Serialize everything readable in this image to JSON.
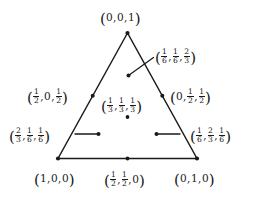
{
  "figure": {
    "type": "2-simplex-barycentric-diagram",
    "stroke_color": "#1a1a1a",
    "background_color": "#ffffff",
    "text_color": "#1a1a1a"
  },
  "labels": {
    "top_vertex": "(0, 0, 1)",
    "bottom_left_vertex": "(1, 0, 0)",
    "bottom_right_vertex": "(0, 1, 0)",
    "bottom_midpoint": "(1/2, 1/2, 0)",
    "left_midpoint": "(1/2, 0, 1/2)",
    "right_midpoint": "(0, 1/2, 1/2)",
    "centroid": "(1/3, 1/3, 1/3)",
    "upper_interior": "(1/6, 1/6, 2/3)",
    "lower_left_interior": "(2/3, 1/6, 1/6)",
    "lower_right_interior": "(1/6, 2/3, 1/6)"
  },
  "points": [
    {
      "name": "top-vertex",
      "label": "(0, 0, 1)",
      "barycentric": [
        0,
        0,
        1
      ]
    },
    {
      "name": "bottom-left-vertex",
      "label": "(1, 0, 0)",
      "barycentric": [
        1,
        0,
        0
      ]
    },
    {
      "name": "bottom-right-vertex",
      "label": "(0, 1, 0)",
      "barycentric": [
        0,
        1,
        0
      ]
    },
    {
      "name": "bottom-edge-midpoint",
      "label": "(1/2, 1/2, 0)",
      "barycentric": [
        0.5,
        0.5,
        0
      ]
    },
    {
      "name": "left-edge-midpoint",
      "label": "(1/2, 0, 1/2)",
      "barycentric": [
        0.5,
        0,
        0.5
      ]
    },
    {
      "name": "right-edge-midpoint",
      "label": "(0, 1/2, 1/2)",
      "barycentric": [
        0,
        0.5,
        0.5
      ]
    },
    {
      "name": "centroid",
      "label": "(1/3, 1/3, 1/3)",
      "barycentric": [
        0.3333,
        0.3333,
        0.3333
      ]
    },
    {
      "name": "upper-interior-point",
      "label": "(1/6, 1/6, 2/3)",
      "barycentric": [
        0.1667,
        0.1667,
        0.6667
      ]
    },
    {
      "name": "lower-left-interior-point",
      "label": "(2/3, 1/6, 1/6)",
      "barycentric": [
        0.6667,
        0.1667,
        0.1667
      ]
    },
    {
      "name": "lower-right-interior-point",
      "label": "(1/6, 2/3, 1/6)",
      "barycentric": [
        0.1667,
        0.6667,
        0.1667
      ]
    }
  ]
}
